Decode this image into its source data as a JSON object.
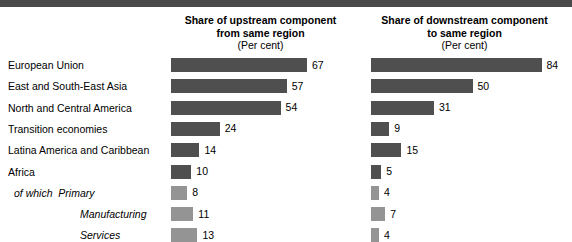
{
  "figure": {
    "panels": [
      {
        "id": "upstream",
        "title_line1": "Share of upstream component",
        "title_line2": "from same region",
        "units": "(Per cent)"
      },
      {
        "id": "downstream",
        "title_line1": "Share of downstream component",
        "title_line2": "to same region",
        "units": "(Per cent)"
      }
    ],
    "colors": {
      "bar_dark": "#4f4f4f",
      "bar_light": "#949494",
      "rule": "#4a4a4a",
      "text": "#000000"
    },
    "of_which_prefix": "of which"
  },
  "chart_data": {
    "type": "bar",
    "title": "",
    "xlabel": "Per cent",
    "ylabel": "",
    "xlim": [
      0,
      90
    ],
    "grid": false,
    "legend": "none",
    "orientation": "horizontal",
    "categories": [
      "European Union",
      "East and South-East Asia",
      "North and Central America",
      "Transition economies",
      "Latina America and Caribbean",
      "Africa",
      "Primary",
      "Manufacturing",
      "Services"
    ],
    "series": [
      {
        "name": "Share of upstream component from same region (Per cent)",
        "values": [
          67,
          57,
          54,
          24,
          14,
          10,
          8,
          11,
          13
        ]
      },
      {
        "name": "Share of downstream component to same region (Per cent)",
        "values": [
          84,
          50,
          31,
          9,
          15,
          5,
          4,
          7,
          4
        ]
      }
    ],
    "row_styles": [
      "region",
      "region",
      "region",
      "region",
      "region",
      "region",
      "sub",
      "sub",
      "sub"
    ]
  }
}
